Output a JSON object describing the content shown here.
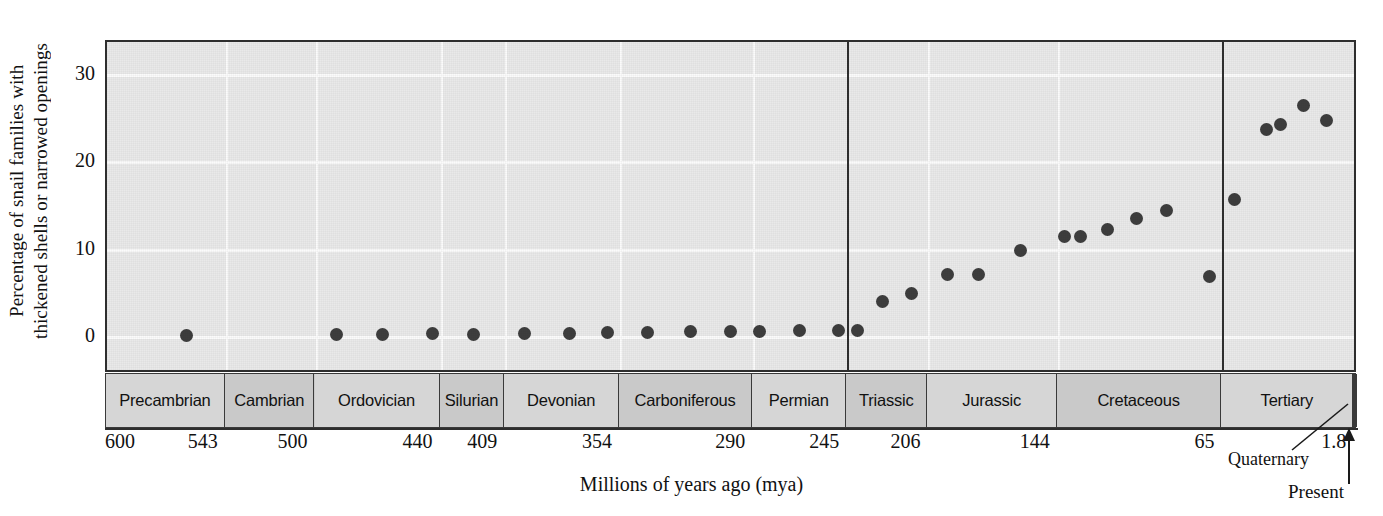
{
  "axes": {
    "ylabel_line1": "Percentage of snail families with",
    "ylabel_line2": "thickened shells or narrowed openings",
    "xlabel": "Millions of years ago (mya)",
    "yticks": [
      "0",
      "10",
      "20",
      "30"
    ],
    "xticks": [
      "600",
      "543",
      "500",
      "440",
      "409",
      "354",
      "290",
      "245",
      "206",
      "144",
      "65",
      "1.8"
    ]
  },
  "annotations": {
    "quaternary": "Quaternary",
    "present": "Present"
  },
  "periods": [
    {
      "label": "Precambrian",
      "start_mya": 600,
      "end_mya": 543
    },
    {
      "label": "Cambrian",
      "start_mya": 543,
      "end_mya": 500
    },
    {
      "label": "Ordovician",
      "start_mya": 500,
      "end_mya": 440
    },
    {
      "label": "Silurian",
      "start_mya": 440,
      "end_mya": 409
    },
    {
      "label": "Devonian",
      "start_mya": 409,
      "end_mya": 354
    },
    {
      "label": "Carboniferous",
      "start_mya": 354,
      "end_mya": 290
    },
    {
      "label": "Permian",
      "start_mya": 290,
      "end_mya": 245
    },
    {
      "label": "Triassic",
      "start_mya": 245,
      "end_mya": 206
    },
    {
      "label": "Jurassic",
      "start_mya": 206,
      "end_mya": 144
    },
    {
      "label": "Cretaceous",
      "start_mya": 144,
      "end_mya": 65
    },
    {
      "label": "Tertiary",
      "start_mya": 65,
      "end_mya": 1.8
    },
    {
      "label": "Quaternary",
      "start_mya": 1.8,
      "end_mya": 0
    }
  ],
  "colors": {
    "plot_background": "#e9e9e9",
    "gridline": "#fbfbfb",
    "frame": "#2e2e2e",
    "marker": "#3d3d3d",
    "period_band": "#c9c9c9",
    "period_band_light": "#d6d6d6",
    "quaternary_band": "#3a3a3a"
  },
  "chart_data": {
    "type": "scatter",
    "title": "",
    "xlabel": "Millions of years ago (mya)",
    "ylabel": "Percentage of snail families with thickened shells or narrowed openings",
    "xlim": [
      600,
      0
    ],
    "ylim": [
      -3,
      34
    ],
    "x_axis_reversed": true,
    "grid": true,
    "legend": false,
    "yticks": [
      0,
      10,
      20,
      30
    ],
    "xticks": [
      600,
      543,
      500,
      440,
      409,
      354,
      290,
      245,
      206,
      144,
      65,
      1.8
    ],
    "era_boundaries_mya": [
      245,
      65
    ],
    "points": [
      {
        "x": 562,
        "y": 0.2
      },
      {
        "x": 490,
        "y": 0.3
      },
      {
        "x": 468,
        "y": 0.3
      },
      {
        "x": 444,
        "y": 0.4
      },
      {
        "x": 424,
        "y": 0.3
      },
      {
        "x": 400,
        "y": 0.4
      },
      {
        "x": 378,
        "y": 0.4
      },
      {
        "x": 360,
        "y": 0.5
      },
      {
        "x": 341,
        "y": 0.5
      },
      {
        "x": 320,
        "y": 0.6
      },
      {
        "x": 301,
        "y": 0.6
      },
      {
        "x": 287,
        "y": 0.6
      },
      {
        "x": 268,
        "y": 0.7
      },
      {
        "x": 249,
        "y": 0.7
      },
      {
        "x": 240,
        "y": 0.8
      },
      {
        "x": 228,
        "y": 4.1
      },
      {
        "x": 214,
        "y": 5.0
      },
      {
        "x": 197,
        "y": 7.2
      },
      {
        "x": 182,
        "y": 7.1
      },
      {
        "x": 162,
        "y": 9.9
      },
      {
        "x": 141,
        "y": 11.5
      },
      {
        "x": 133,
        "y": 11.5
      },
      {
        "x": 120,
        "y": 12.3
      },
      {
        "x": 106,
        "y": 13.6
      },
      {
        "x": 92,
        "y": 14.5
      },
      {
        "x": 71,
        "y": 6.9
      },
      {
        "x": 59,
        "y": 15.8
      },
      {
        "x": 44,
        "y": 23.8
      },
      {
        "x": 37,
        "y": 24.3
      },
      {
        "x": 26,
        "y": 26.5
      },
      {
        "x": 15,
        "y": 24.8
      }
    ]
  }
}
